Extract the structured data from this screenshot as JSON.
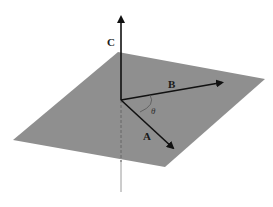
{
  "diagram": {
    "type": "vector-cross-product",
    "plane": {
      "fill": "#8f8f8f",
      "corners": [
        [
          118,
          52
        ],
        [
          265,
          79
        ],
        [
          165,
          167
        ],
        [
          13,
          140
        ]
      ]
    },
    "origin": [
      121,
      100
    ],
    "vectors": {
      "A": {
        "label": "A",
        "tip": [
          175,
          150
        ],
        "label_pos": [
          142,
          138
        ]
      },
      "B": {
        "label": "B",
        "tip": [
          225,
          82
        ],
        "label_pos": [
          168,
          86
        ]
      },
      "C": {
        "label": "C",
        "tip": [
          121,
          14
        ],
        "label_pos": [
          107,
          46
        ]
      }
    },
    "angle": {
      "label": "θ",
      "label_pos": [
        150,
        112
      ]
    },
    "normal_line": {
      "dashed_below_plane": true,
      "bottom": [
        121,
        192
      ]
    },
    "colors": {
      "vector": "#111111",
      "arc": "#555555",
      "dashed": "#666666",
      "normal_below": "#9a9a9a"
    }
  }
}
